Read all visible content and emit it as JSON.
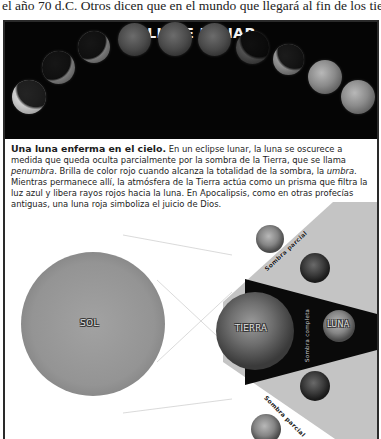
{
  "intro": {
    "text": "el año 70 d.C. Otros dicen que en el mundo que llegará al fin de los tiempos."
  },
  "banner": {
    "title": "ECLIPSE LUNAR",
    "background": "#050505",
    "moon_phases_count": 10
  },
  "caption": {
    "lead": "Una luna enferma en el cielo.",
    "part1": " En un eclipse lunar, la luna se oscurece a medida que queda oculta parcialmente por la sombra de la Tierra, que se llama ",
    "penumbra": "penumbra",
    "part2": ". Brilla de color rojo cuando alcanza la totalidad de la sombra, la ",
    "umbra": "umbra",
    "part3": ". Mientras permanece allí, la atmósfera de la Tierra actúa como un prisma que filtra la luz azul y libera rayos rojos hacia la luna. En Apocalipsis, como en otras profecías antiguas, una luna roja simboliza el juicio de Dios."
  },
  "diagram": {
    "sun_label": "SOL",
    "earth_label": "TIERRA",
    "moon_label": "LUNA",
    "penumbra_label_top": "Sombra parcial",
    "penumbra_label_bottom": "Sombra parcial",
    "umbra_label": "Sombra completa",
    "colors": {
      "penumbra": "#c4c4c4",
      "umbra": "#0a0a0a",
      "sun": "#9a9a9a",
      "light_rays": "#cfcfcf"
    }
  }
}
